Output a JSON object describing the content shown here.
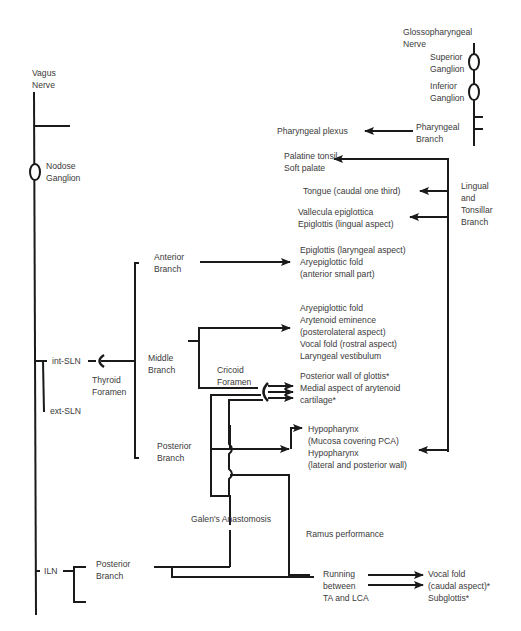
{
  "glossopharyngeal": {
    "nerve": [
      "Glossopharyngeal",
      "Nerve"
    ],
    "superior_ganglion": [
      "Superior",
      "Ganglion"
    ],
    "inferior_ganglion": [
      "Inferior",
      "Ganglion"
    ],
    "pharyngeal_branch": [
      "Pharyngeal",
      "Branch"
    ],
    "lingual_tonsillar_branch": [
      "Lingual",
      "and",
      "Tonsillar",
      "Branch"
    ]
  },
  "vagus": {
    "nerve": [
      "Vagus",
      "Nerve"
    ],
    "nodose_ganglion": [
      "Nodose",
      "Ganglion"
    ],
    "int_sln": "int-SLN",
    "ext_sln": "ext-SLN",
    "iln": "ILN",
    "thyroid_foramen": [
      "Thyroid",
      "Foramen"
    ],
    "anterior_branch": [
      "Anterior",
      "Branch"
    ],
    "middle_branch": [
      "Middle",
      "Branch"
    ],
    "posterior_branch_sln": [
      "Posterior",
      "Branch"
    ],
    "cricoid_foramen": [
      "Cricoid",
      "Foramen"
    ],
    "galens_anastomosis": "Galen's Anastomosis",
    "ramus_performance": "Ramus performance",
    "posterior_branch_iln": [
      "Posterior",
      "Branch"
    ],
    "running_between": [
      "Running",
      "between",
      "TA and LCA"
    ]
  },
  "targets": {
    "pharyngeal_plexus": "Pharyngeal plexus",
    "palatine": [
      "Palatine tonsil",
      "Soft palate"
    ],
    "tongue": "Tongue (caudal one third)",
    "vallecula": [
      "Vallecula epiglottica",
      "Epiglottis (lingual aspect)"
    ],
    "epiglottis_laryngeal": [
      "Epiglottis (laryngeal aspect)",
      "Aryepiglottic fold",
      "(anterior small part)"
    ],
    "middle_targets": [
      "Aryepiglottic fold",
      "Arytenoid eminence",
      "(posterolateral aspect)",
      "Vocal fold (rostral aspect)",
      "Laryngeal vestibulum"
    ],
    "posterior_glottis": [
      "Posterior wall of glottis*",
      "Medial aspect of arytenoid",
      "cartilage*"
    ],
    "hypopharynx": [
      "Hypopharynx",
      "(Mucosa covering PCA)",
      "Hypopharynx",
      "(lateral and posterior wall)"
    ],
    "vocal_fold_caudal": [
      "Vocal fold",
      "(caudal aspect)*",
      "Subglottis*"
    ]
  },
  "colors": {
    "line": "#1a1a1a",
    "text": "#3a3a3a",
    "background": "#ffffff"
  }
}
